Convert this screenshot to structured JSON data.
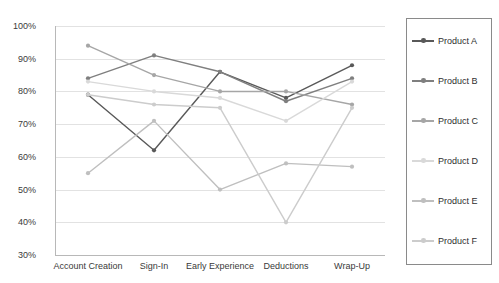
{
  "chart_data": {
    "type": "line",
    "title": "",
    "xlabel": "",
    "ylabel": "",
    "ylim": [
      30,
      100
    ],
    "ytick_step": 10,
    "grid": true,
    "legend_position": "right",
    "categories": [
      "Account Creation",
      "Sign-In",
      "Early Experience",
      "Deductions",
      "Wrap-Up"
    ],
    "ytick_labels": [
      "100%",
      "90%",
      "80%",
      "70%",
      "60%",
      "50%",
      "40%",
      "30%"
    ],
    "ytick_values": [
      100,
      90,
      80,
      70,
      60,
      50,
      40,
      30
    ],
    "series": [
      {
        "name": "Product A",
        "color": "#595959",
        "values": [
          79,
          62,
          86,
          78,
          88
        ]
      },
      {
        "name": "Product B",
        "color": "#7f7f7f",
        "values": [
          84,
          91,
          86,
          77,
          84
        ]
      },
      {
        "name": "Product C",
        "color": "#a6a6a6",
        "values": [
          94,
          85,
          80,
          80,
          76
        ]
      },
      {
        "name": "Product D",
        "color": "#d9d9d9",
        "values": [
          83,
          80,
          78,
          71,
          83
        ]
      },
      {
        "name": "Product E",
        "color": "#bfbfbf",
        "values": [
          55,
          71,
          50,
          58,
          57
        ]
      },
      {
        "name": "Product F",
        "color": "#cccccc",
        "values": [
          79,
          76,
          75,
          40,
          75
        ]
      }
    ]
  },
  "legend": {
    "items": [
      {
        "label": "Product A"
      },
      {
        "label": "Product B"
      },
      {
        "label": "Product C"
      },
      {
        "label": "Product D"
      },
      {
        "label": "Product E"
      },
      {
        "label": "Product F"
      }
    ]
  },
  "axes": {
    "grid_color": "#e2e2e2",
    "axis_color": "#b8b8b8",
    "tick_text_color": "#3a3a3a"
  }
}
